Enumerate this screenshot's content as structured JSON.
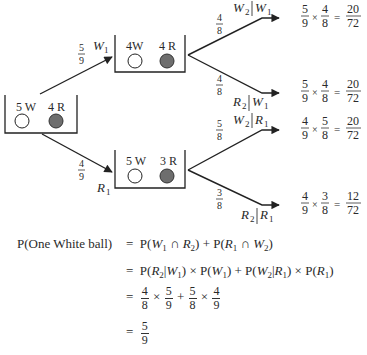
{
  "tree": {
    "root_urn": {
      "label_white": "5 W",
      "label_red": "4 R"
    },
    "first_draw": [
      {
        "event": "W1",
        "event_letter": "W",
        "event_sub": "1",
        "prob_num": "5",
        "prob_den": "9",
        "urn": {
          "label_white": "4W",
          "label_red": "4 R"
        },
        "branches": [
          {
            "label": "W2|W1",
            "given_letter": "W",
            "given_sub": "2",
            "cond_letter": "W",
            "cond_sub": "1",
            "prob_num": "4",
            "prob_den": "8",
            "result": {
              "a_num": "5",
              "a_den": "9",
              "b_num": "4",
              "b_den": "8",
              "r_num": "20",
              "r_den": "72"
            }
          },
          {
            "label": "R2|W1",
            "given_letter": "R",
            "given_sub": "2",
            "cond_letter": "W",
            "cond_sub": "1",
            "prob_num": "4",
            "prob_den": "8",
            "result": {
              "a_num": "5",
              "a_den": "9",
              "b_num": "4",
              "b_den": "8",
              "r_num": "20",
              "r_den": "72"
            }
          }
        ]
      },
      {
        "event": "R1",
        "event_letter": "R",
        "event_sub": "1",
        "prob_num": "4",
        "prob_den": "9",
        "urn": {
          "label_white": "5 W",
          "label_red": "3 R"
        },
        "branches": [
          {
            "label": "W2|R1",
            "given_letter": "W",
            "given_sub": "2",
            "cond_letter": "R",
            "cond_sub": "1",
            "prob_num": "5",
            "prob_den": "8",
            "result": {
              "a_num": "4",
              "a_den": "9",
              "b_num": "5",
              "b_den": "8",
              "r_num": "20",
              "r_den": "72"
            }
          },
          {
            "label": "R2|R1",
            "given_letter": "R",
            "given_sub": "2",
            "cond_letter": "R",
            "cond_sub": "1",
            "prob_num": "3",
            "prob_den": "8",
            "result": {
              "a_num": "4",
              "a_den": "9",
              "b_num": "3",
              "b_den": "8",
              "r_num": "12",
              "r_den": "72"
            }
          }
        ]
      }
    ],
    "colors": {
      "white_ball": "#ffffff",
      "red_ball": "#6e6e6e",
      "line": "#222222"
    }
  },
  "derivation": {
    "lhs": "P(One White ball)",
    "equals": "=",
    "line1": {
      "t1_p": "P(",
      "t1_a": "W",
      "t1_as": "1",
      "t1_cap": " ∩ ",
      "t1_b": "R",
      "t1_bs": "2",
      "t1_close": ")",
      "plus": " + ",
      "t2_p": "P(",
      "t2_a": "R",
      "t2_as": "1",
      "t2_cap": " ∩ ",
      "t2_b": "W",
      "t2_bs": "2",
      "t2_close": ")"
    },
    "line2_text": "P(R2|W1) × P(W1) + P(W2|R1) × P(R1)",
    "line3": {
      "f1_num": "4",
      "f1_den": "8",
      "f2_num": "5",
      "f2_den": "9",
      "f3_num": "5",
      "f3_den": "8",
      "f4_num": "4",
      "f4_den": "9",
      "times": "×",
      "plus": "+"
    },
    "result": {
      "num": "5",
      "den": "9"
    }
  }
}
